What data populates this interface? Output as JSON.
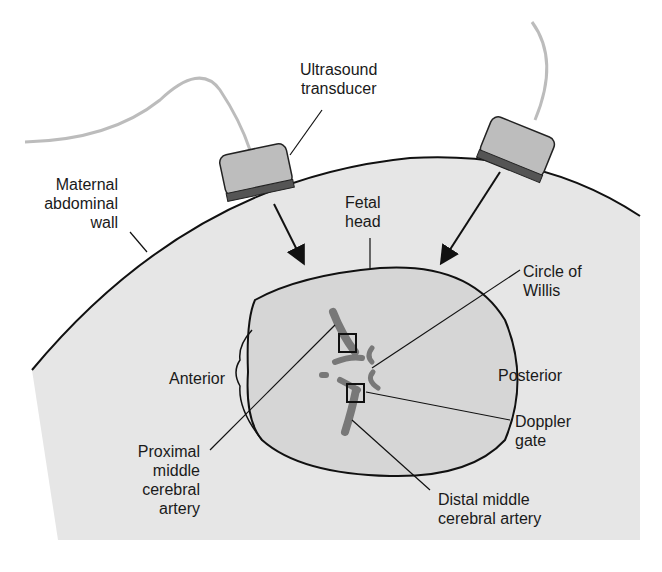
{
  "colors": {
    "background": "#ffffff",
    "abdomen_fill": "#e6e6e6",
    "head_fill": "#d6d6d6",
    "outline": "#111111",
    "transducer_fill": "#bdbdbd",
    "transducer_face": "#555555",
    "cable": "#bcbcbc",
    "vessel": "#6e6e6e"
  },
  "labels": {
    "ultrasound_transducer": "Ultrasound\ntransducer",
    "maternal_abdominal_wall": "Maternal\nabdominal\nwall",
    "fetal_head": "Fetal\nhead",
    "circle_of_willis": "Circle of\nWillis",
    "anterior": "Anterior",
    "posterior": "Posterior",
    "doppler_gate": "Doppler\ngate",
    "proximal_mca": "Proximal\nmiddle\ncerebral\nartery",
    "distal_mca": "Distal middle\ncerebral artery"
  }
}
